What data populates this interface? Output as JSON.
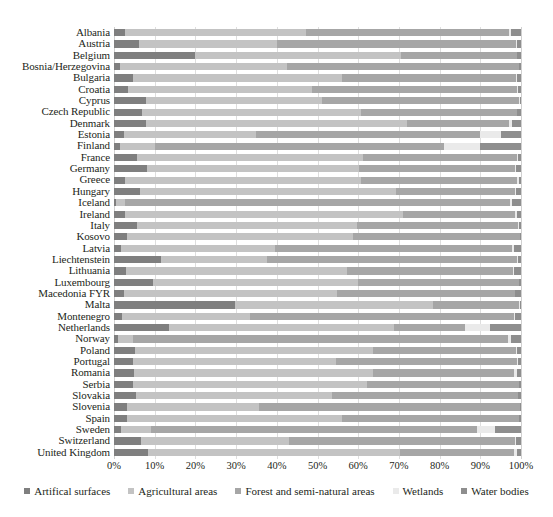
{
  "chart_data": {
    "type": "bar",
    "orientation": "horizontal",
    "stacked": true,
    "normalized": true,
    "title": "",
    "xlabel": "",
    "ylabel": "",
    "xlim": [
      0,
      100
    ],
    "xticks": [
      "0%",
      "10%",
      "20%",
      "30%",
      "40%",
      "50%",
      "60%",
      "70%",
      "80%",
      "90%",
      "100%"
    ],
    "grid": true,
    "legend_position": "bottom",
    "series": [
      {
        "name": "Artifical surfaces",
        "color": "#7f7f7f"
      },
      {
        "name": "Agricultural areas",
        "color": "#c3c3c3"
      },
      {
        "name": "Forest and semi-natural areas",
        "color": "#a6a6a6"
      },
      {
        "name": "Wetlands",
        "color": "#eaeaea"
      },
      {
        "name": "Water bodies",
        "color": "#8e8e8e"
      }
    ],
    "categories": [
      "Albania",
      "Austria",
      "Belgium",
      "Bosnia/Herzegovina",
      "Bulgaria",
      "Croatia",
      "Cyprus",
      "Czech Republic",
      "Denmark",
      "Estonia",
      "Finland",
      "France",
      "Germany",
      "Greece",
      "Hungary",
      "Iceland",
      "Ireland",
      "Italy",
      "Kosovo",
      "Latvia",
      "Liechtenstein",
      "Lithuania",
      "Luxembourg",
      "Macedonia FYR",
      "Malta",
      "Montenegro",
      "Netherlands",
      "Norway",
      "Poland",
      "Portugal",
      "Romania",
      "Serbia",
      "Slovakia",
      "Slovenia",
      "Spain",
      "Sweden",
      "Switzerland",
      "United Kingdom"
    ],
    "rows": [
      {
        "country": "Albania",
        "values": [
          2.6,
          44.5,
          50.0,
          0.4,
          2.5
        ]
      },
      {
        "country": "Austria",
        "values": [
          6.1,
          34.0,
          58.6,
          0.3,
          1.0
        ]
      },
      {
        "country": "Belgium",
        "values": [
          19.8,
          50.6,
          28.5,
          0.2,
          0.9
        ]
      },
      {
        "country": "Bosnia/Herzegovina",
        "values": [
          1.5,
          41.0,
          56.9,
          0.1,
          0.5
        ]
      },
      {
        "country": "Bulgaria",
        "values": [
          4.7,
          51.3,
          42.8,
          0.1,
          1.1
        ]
      },
      {
        "country": "Croatia",
        "values": [
          3.4,
          45.2,
          50.4,
          0.2,
          0.8
        ]
      },
      {
        "country": "Cyprus",
        "values": [
          7.8,
          43.3,
          48.5,
          0.1,
          0.3
        ]
      },
      {
        "country": "Czech Republic",
        "values": [
          6.8,
          53.8,
          38.3,
          0.1,
          1.0
        ]
      },
      {
        "country": "Denmark",
        "values": [
          7.8,
          64.2,
          25.1,
          0.6,
          2.3
        ]
      },
      {
        "country": "Estonia",
        "values": [
          2.5,
          32.3,
          55.2,
          5.2,
          4.8
        ]
      },
      {
        "country": "Finland",
        "values": [
          1.5,
          8.5,
          71.0,
          9.0,
          10.0
        ]
      },
      {
        "country": "France",
        "values": [
          5.6,
          55.5,
          37.9,
          0.3,
          0.7
        ]
      },
      {
        "country": "Germany",
        "values": [
          8.2,
          52.0,
          38.4,
          0.2,
          1.2
        ]
      },
      {
        "country": "Greece",
        "values": [
          2.8,
          58.0,
          38.3,
          0.3,
          0.6
        ]
      },
      {
        "country": "Hungary",
        "values": [
          6.5,
          62.8,
          29.3,
          0.1,
          1.3
        ]
      },
      {
        "country": "Iceland",
        "values": [
          0.6,
          2.0,
          94.6,
          0.6,
          2.2
        ]
      },
      {
        "country": "Ireland",
        "values": [
          2.6,
          68.5,
          27.4,
          0.5,
          1.0
        ]
      },
      {
        "country": "Italy",
        "values": [
          5.7,
          54.1,
          39.5,
          0.1,
          0.6
        ]
      },
      {
        "country": "Kosovo",
        "values": [
          3.2,
          55.5,
          41.0,
          0.1,
          0.2
        ]
      },
      {
        "country": "Latvia",
        "values": [
          1.7,
          37.8,
          58.4,
          0.5,
          1.6
        ]
      },
      {
        "country": "Liechtenstein",
        "values": [
          11.5,
          26.0,
          61.5,
          0.2,
          0.8
        ]
      },
      {
        "country": "Lithuania",
        "values": [
          3.0,
          54.3,
          40.7,
          0.4,
          1.6
        ]
      },
      {
        "country": "Luxembourg",
        "values": [
          9.6,
          50.3,
          39.6,
          0.1,
          0.4
        ]
      },
      {
        "country": "Macedonia FYR",
        "values": [
          2.4,
          52.5,
          43.6,
          0.1,
          1.4
        ]
      },
      {
        "country": "Malta",
        "values": [
          29.8,
          48.5,
          21.3,
          0.1,
          0.3
        ]
      },
      {
        "country": "Montenegro",
        "values": [
          2.0,
          31.5,
          64.9,
          0.1,
          1.5
        ]
      },
      {
        "country": "Netherlands",
        "values": [
          13.4,
          55.4,
          17.5,
          6.0,
          7.7
        ]
      },
      {
        "country": "Norway",
        "values": [
          0.9,
          3.8,
          92.2,
          0.6,
          2.5
        ]
      },
      {
        "country": "Poland",
        "values": [
          5.1,
          58.5,
          35.2,
          0.2,
          1.0
        ]
      },
      {
        "country": "Portugal",
        "values": [
          4.6,
          50.0,
          44.4,
          0.2,
          0.8
        ]
      },
      {
        "country": "Romania",
        "values": [
          5.0,
          58.6,
          34.8,
          0.5,
          1.1
        ]
      },
      {
        "country": "Serbia",
        "values": [
          4.6,
          57.5,
          37.3,
          0.1,
          0.5
        ]
      },
      {
        "country": "Slovakia",
        "values": [
          5.4,
          48.2,
          45.6,
          0.1,
          0.7
        ]
      },
      {
        "country": "Slovenia",
        "values": [
          3.1,
          32.5,
          64.1,
          0.1,
          0.2
        ]
      },
      {
        "country": "Spain",
        "values": [
          3.1,
          53.0,
          43.3,
          0.2,
          0.4
        ]
      },
      {
        "country": "Sweden",
        "values": [
          1.7,
          7.5,
          80.0,
          4.3,
          6.5
        ]
      },
      {
        "country": "Switzerland",
        "values": [
          6.6,
          36.5,
          55.4,
          0.2,
          1.3
        ]
      },
      {
        "country": "United Kingdom",
        "values": [
          8.3,
          62.0,
          28.0,
          0.7,
          1.0
        ]
      }
    ]
  }
}
